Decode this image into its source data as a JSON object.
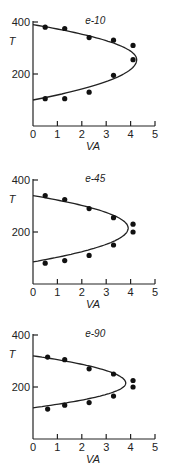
{
  "chart_data": [
    {
      "type": "scatter",
      "title": "e-10",
      "xlabel": "VA",
      "ylabel": "T",
      "xlim": [
        0,
        5
      ],
      "ylim": [
        0,
        400
      ],
      "xticks": [
        "0",
        "1",
        "2",
        "3",
        "4",
        "5"
      ],
      "yticks": [
        "200",
        "400"
      ],
      "grid": false,
      "points": [
        [
          0.5,
          380
        ],
        [
          1.3,
          375
        ],
        [
          2.3,
          340
        ],
        [
          3.3,
          330
        ],
        [
          4.1,
          310
        ],
        [
          4.1,
          255
        ],
        [
          3.3,
          195
        ],
        [
          2.3,
          130
        ],
        [
          1.3,
          105
        ],
        [
          0.5,
          105
        ]
      ],
      "curve": {
        "vertex_x": 4.25,
        "vertex_y": 255,
        "top_y0": 390,
        "bottom_y0": 100
      }
    },
    {
      "type": "scatter",
      "title": "e-45",
      "xlabel": "VA",
      "ylabel": "T",
      "xlim": [
        0,
        5
      ],
      "ylim": [
        0,
        400
      ],
      "xticks": [
        "0",
        "1",
        "2",
        "3",
        "4",
        "5"
      ],
      "yticks": [
        "200",
        "400"
      ],
      "grid": false,
      "points": [
        [
          0.5,
          340
        ],
        [
          1.3,
          325
        ],
        [
          2.3,
          290
        ],
        [
          3.3,
          255
        ],
        [
          4.1,
          230
        ],
        [
          4.1,
          200
        ],
        [
          3.3,
          150
        ],
        [
          2.3,
          110
        ],
        [
          1.3,
          90
        ],
        [
          0.5,
          80
        ]
      ],
      "curve": {
        "vertex_x": 3.9,
        "vertex_y": 215,
        "top_y0": 340,
        "bottom_y0": 85
      }
    },
    {
      "type": "scatter",
      "title": "e-90",
      "xlabel": "VA",
      "ylabel": "T",
      "xlim": [
        0,
        5
      ],
      "ylim": [
        0,
        400
      ],
      "xticks": [
        "0",
        "1",
        "2",
        "3",
        "4",
        "5"
      ],
      "yticks": [
        "200",
        "400"
      ],
      "grid": false,
      "points": [
        [
          0.6,
          315
        ],
        [
          1.3,
          305
        ],
        [
          2.3,
          270
        ],
        [
          3.3,
          250
        ],
        [
          4.1,
          225
        ],
        [
          4.1,
          200
        ],
        [
          3.3,
          165
        ],
        [
          2.3,
          140
        ],
        [
          1.3,
          130
        ],
        [
          0.6,
          115
        ]
      ],
      "curve": {
        "vertex_x": 3.8,
        "vertex_y": 215,
        "top_y0": 320,
        "bottom_y0": 120
      }
    }
  ],
  "layout": {
    "panels": [
      {
        "axis_x": 33,
        "zero_y": 126
      },
      {
        "axis_x": 33,
        "zero_y": 284
      },
      {
        "axis_x": 33,
        "zero_y": 439
      }
    ],
    "px_per_x": 24.4,
    "px_per_y": 0.26
  }
}
